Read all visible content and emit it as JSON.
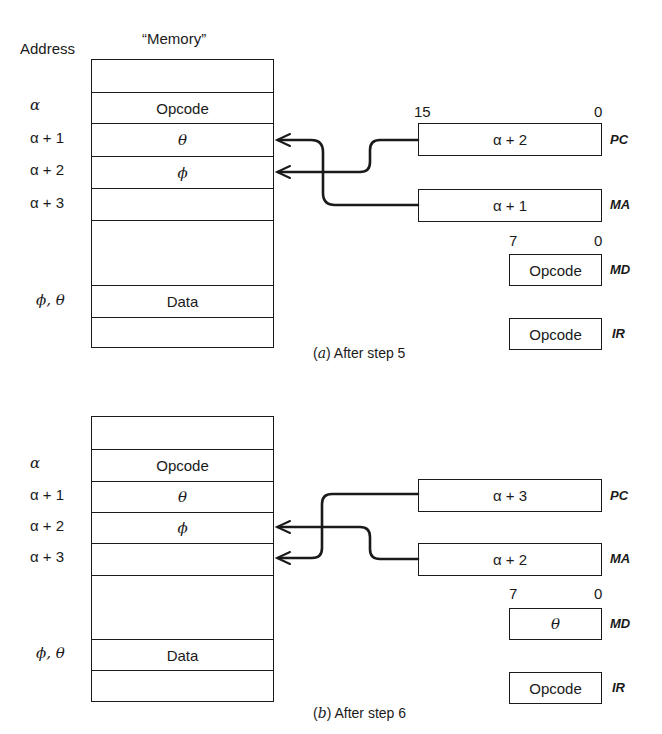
{
  "panels": [
    {
      "id": "a",
      "caption_letter": "a",
      "caption_text": "After step 5",
      "address_header": "Address",
      "memory_header": "“Memory”",
      "memory_cells": [
        "",
        "Opcode",
        "θ",
        "ϕ",
        "",
        "",
        "Data",
        ""
      ],
      "addresses": [
        "",
        "α",
        "α + 1",
        "α + 2",
        "α + 3",
        "",
        "ϕ, θ",
        ""
      ],
      "wide_bits": {
        "high": "15",
        "low": "0"
      },
      "narrow_bits": {
        "high": "7",
        "low": "0"
      },
      "registers": {
        "PC": {
          "label": "PC",
          "value": "α + 2",
          "points_to": "α + 2"
        },
        "MA": {
          "label": "MA",
          "value": "α + 1",
          "points_to": "α + 1"
        },
        "MD": {
          "label": "MD",
          "value": "Opcode"
        },
        "IR": {
          "label": "IR",
          "value": "Opcode"
        }
      }
    },
    {
      "id": "b",
      "caption_letter": "b",
      "caption_text": "After step 6",
      "memory_cells": [
        "",
        "Opcode",
        "θ",
        "ϕ",
        "",
        "",
        "Data",
        ""
      ],
      "addresses": [
        "",
        "α",
        "α + 1",
        "α + 2",
        "α + 3",
        "",
        "ϕ, θ",
        ""
      ],
      "narrow_bits": {
        "high": "7",
        "low": "0"
      },
      "registers": {
        "PC": {
          "label": "PC",
          "value": "α + 3",
          "points_to": "α + 3"
        },
        "MA": {
          "label": "MA",
          "value": "α + 2",
          "points_to": "α + 2"
        },
        "MD": {
          "label": "MD",
          "value": "θ"
        },
        "IR": {
          "label": "IR",
          "value": "Opcode"
        }
      }
    }
  ]
}
